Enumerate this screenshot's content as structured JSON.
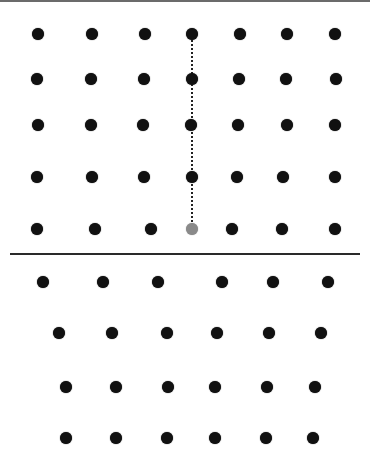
{
  "colors": {
    "dot": "#111111",
    "highlight_dot": "#8a8a8a",
    "divider": "#2a2a2a",
    "top_border": "#6b6b6b"
  },
  "top_grid": {
    "rows": [
      {
        "y": 34,
        "xs": [
          38,
          92,
          145,
          192,
          240,
          287,
          335
        ]
      },
      {
        "y": 79,
        "xs": [
          37,
          91,
          144,
          192,
          239,
          286,
          336
        ]
      },
      {
        "y": 125,
        "xs": [
          38,
          91,
          143,
          191,
          238,
          287,
          335
        ]
      },
      {
        "y": 177,
        "xs": [
          37,
          92,
          144,
          192,
          237,
          283,
          335
        ]
      },
      {
        "y": 229,
        "xs": [
          37,
          95,
          151,
          192,
          232,
          282,
          335
        ]
      }
    ],
    "highlight": {
      "row": 4,
      "col": 3
    },
    "dotted_line": {
      "x": 192,
      "y1": 40,
      "y2": 222
    }
  },
  "divider": {
    "y": 254,
    "x1": 10,
    "x2": 360
  },
  "bottom_grid": {
    "rows": [
      {
        "y": 282,
        "xs": [
          43,
          103,
          158,
          222,
          273,
          328
        ]
      },
      {
        "y": 333,
        "xs": [
          59,
          112,
          167,
          217,
          269,
          321
        ]
      },
      {
        "y": 387,
        "xs": [
          66,
          116,
          168,
          215,
          267,
          315
        ]
      },
      {
        "y": 438,
        "xs": [
          66,
          116,
          167,
          215,
          266,
          313
        ]
      }
    ]
  }
}
